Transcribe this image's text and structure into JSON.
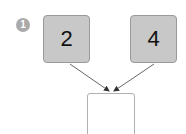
{
  "problem_number": "1",
  "inputs": [
    {
      "value": "2"
    },
    {
      "value": "4"
    }
  ],
  "answer": {
    "value": ""
  },
  "colors": {
    "box_fill": "#c8c8c8",
    "badge": "#aaaaaa",
    "arrow": "#555555"
  }
}
